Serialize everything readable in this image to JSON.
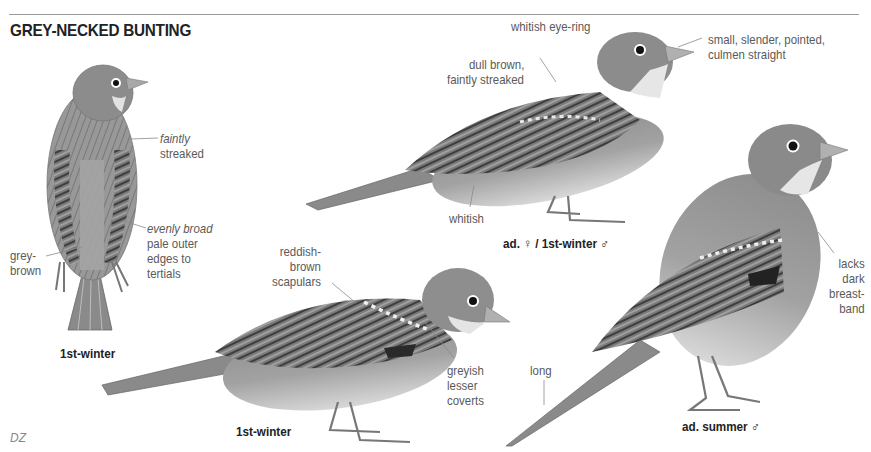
{
  "title": "GREY-NECKED BUNTING",
  "credit": "DZ",
  "figures": [
    {
      "id": "back-view",
      "caption": "1st-winter",
      "annotations": [
        {
          "text_italic": "faintly",
          "text": "streaked"
        },
        {
          "text_italic": "evenly broad",
          "text": [
            "pale outer",
            "edges to",
            "tertials"
          ]
        },
        {
          "text": [
            "grey-",
            "brown"
          ]
        }
      ]
    },
    {
      "id": "adult-female",
      "caption": "ad. ♀ / 1st-winter ♂",
      "annotations": [
        {
          "text": "whitish eye-ring"
        },
        {
          "text": [
            "small, slender, pointed,",
            "culmen straight"
          ]
        },
        {
          "text": [
            "dull brown,",
            "faintly streaked"
          ]
        },
        {
          "text": "whitish"
        }
      ]
    },
    {
      "id": "first-winter-side",
      "caption": "1st-winter",
      "annotations": [
        {
          "text": [
            "reddish-",
            "brown",
            "scapulars"
          ]
        },
        {
          "text": [
            "greyish",
            "lesser",
            "coverts"
          ]
        }
      ]
    },
    {
      "id": "adult-summer-male",
      "caption": "ad. summer ♂",
      "annotations": [
        {
          "text": [
            "lacks",
            "dark",
            "breast-",
            "band"
          ]
        },
        {
          "text": "long"
        }
      ]
    }
  ],
  "colors": {
    "rule": "#9a9a9a",
    "title": "#222222",
    "label": "#5a5a5a",
    "bird_head": "#8c8c8c",
    "bird_body": "#9e9e9e",
    "bird_belly": "#d6d6d6",
    "wing_dark": "#4a4a4a"
  }
}
